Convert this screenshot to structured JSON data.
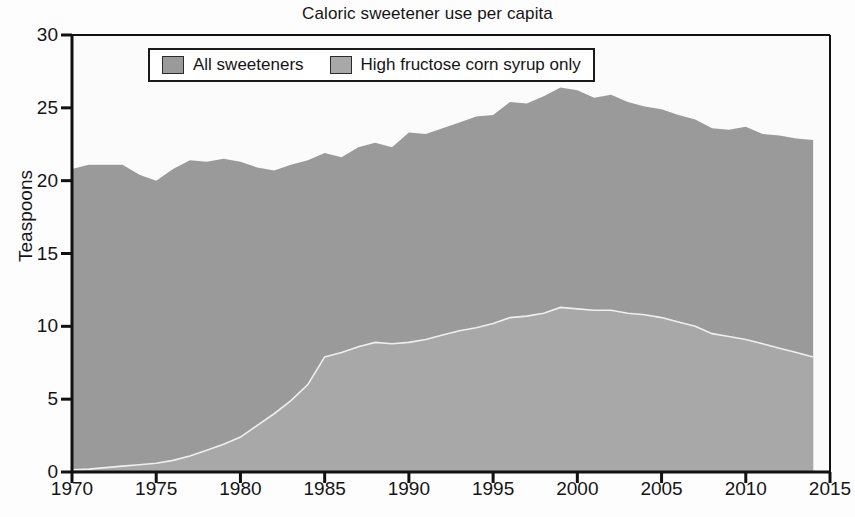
{
  "chart_data": {
    "type": "area",
    "title": "Caloric sweetener use per capita",
    "xlabel": "",
    "ylabel": "Teaspoons",
    "xlim": [
      1970,
      2015
    ],
    "ylim": [
      0,
      30
    ],
    "grid": false,
    "stacked": false,
    "legend_position": "top-center",
    "xticks": [
      "1970",
      "1975",
      "1980",
      "1985",
      "1990",
      "1995",
      "2000",
      "2005",
      "2010",
      "2015"
    ],
    "yticks": [
      "0",
      "5",
      "10",
      "15",
      "20",
      "25",
      "30"
    ],
    "colors": {
      "all_sweeteners": "#9a9a9a",
      "hfcs_only": "#a8a8a8",
      "separator_line": "#efefef",
      "axis": "#111111",
      "background": "#fdfdfd"
    },
    "x": [
      1970,
      1971,
      1972,
      1973,
      1974,
      1975,
      1976,
      1977,
      1978,
      1979,
      1980,
      1981,
      1982,
      1983,
      1984,
      1985,
      1986,
      1987,
      1988,
      1989,
      1990,
      1991,
      1992,
      1993,
      1994,
      1995,
      1996,
      1997,
      1998,
      1999,
      2000,
      2001,
      2002,
      2003,
      2004,
      2005,
      2006,
      2007,
      2008,
      2009,
      2010,
      2011,
      2012,
      2013,
      2014
    ],
    "series": [
      {
        "name": "All sweeteners",
        "color": "#9a9a9a",
        "values": [
          20.8,
          21.1,
          21.1,
          21.1,
          20.4,
          20.0,
          20.8,
          21.4,
          21.3,
          21.5,
          21.3,
          20.9,
          20.7,
          21.1,
          21.4,
          21.9,
          21.6,
          22.3,
          22.6,
          22.3,
          23.3,
          23.2,
          23.6,
          24.0,
          24.4,
          24.5,
          25.4,
          25.3,
          25.8,
          26.4,
          26.2,
          25.7,
          25.9,
          25.4,
          25.1,
          24.9,
          24.5,
          24.2,
          23.6,
          23.5,
          23.7,
          23.2,
          23.1,
          22.9,
          22.8
        ]
      },
      {
        "name": "High fructose corn syrup only",
        "color": "#a8a8a8",
        "values": [
          0.15,
          0.2,
          0.3,
          0.4,
          0.5,
          0.6,
          0.8,
          1.1,
          1.5,
          1.9,
          2.4,
          3.2,
          4.0,
          4.9,
          6.0,
          7.9,
          8.2,
          8.6,
          8.9,
          8.8,
          8.9,
          9.1,
          9.4,
          9.7,
          9.9,
          10.2,
          10.6,
          10.7,
          10.9,
          11.3,
          11.2,
          11.1,
          11.1,
          10.9,
          10.8,
          10.6,
          10.3,
          10.0,
          9.5,
          9.3,
          9.1,
          8.8,
          8.5,
          8.2,
          7.9
        ]
      }
    ]
  }
}
